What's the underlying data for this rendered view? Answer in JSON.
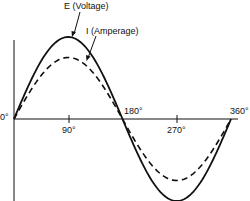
{
  "labels": {
    "voltage": "E (Voltage)",
    "current": "I (Amperage)",
    "tick_0": "0°",
    "tick_90": "90°",
    "tick_180": "180°",
    "tick_270": "270°",
    "tick_360": "360°"
  },
  "colors": {
    "line": "#111111",
    "background": "#ffffff"
  },
  "chart_data": {
    "type": "line",
    "title": "",
    "xlabel": "",
    "ylabel": "",
    "x_ticks": [
      "0°",
      "90°",
      "180°",
      "270°",
      "360°"
    ],
    "x_range": [
      0,
      360
    ],
    "series": [
      {
        "name": "E (Voltage)",
        "style": "solid",
        "amplitude_relative": 1.0,
        "phase_deg": 0,
        "x": [
          0,
          90,
          180,
          270,
          360
        ],
        "values": [
          0,
          1.0,
          0,
          -1.0,
          0
        ]
      },
      {
        "name": "I (Amperage)",
        "style": "dashed",
        "amplitude_relative": 0.75,
        "phase_deg": 0,
        "x": [
          0,
          90,
          180,
          270,
          360
        ],
        "values": [
          0,
          0.75,
          0,
          -0.75,
          0
        ]
      }
    ],
    "grid": false,
    "legend": "callout labels with arrows"
  }
}
